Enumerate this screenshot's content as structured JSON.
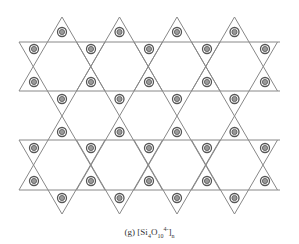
{
  "diagram": {
    "line_color": "#888888",
    "circle_outer_color": "#555555",
    "circle_inner_color": "#999999",
    "layers": [
      {
        "up_apex_y": 17,
        "base_y": 91,
        "down_top_y": 42,
        "down_apex_y": 116
      },
      {
        "up_apex_y": 116,
        "base_y": 190,
        "down_top_y": 140,
        "down_apex_y": 214
      }
    ],
    "star_centers_x": [
      62,
      119.5,
      177,
      234.5
    ],
    "half_width": 43,
    "horizontal_lines": [
      {
        "y": 42,
        "x1": 19,
        "x2": 280
      },
      {
        "y": 91,
        "x1": 19,
        "x2": 280
      },
      {
        "y": 140,
        "x1": 19,
        "x2": 280
      },
      {
        "y": 190,
        "x1": 19,
        "x2": 280
      }
    ],
    "circles": [
      {
        "x": 62,
        "y": 32
      },
      {
        "x": 119.5,
        "y": 32
      },
      {
        "x": 177,
        "y": 32
      },
      {
        "x": 234.5,
        "y": 32
      },
      {
        "x": 34,
        "y": 49
      },
      {
        "x": 91,
        "y": 49
      },
      {
        "x": 149,
        "y": 49
      },
      {
        "x": 207,
        "y": 49
      },
      {
        "x": 265,
        "y": 49
      },
      {
        "x": 34,
        "y": 82
      },
      {
        "x": 91,
        "y": 82
      },
      {
        "x": 149,
        "y": 82
      },
      {
        "x": 207,
        "y": 82
      },
      {
        "x": 265,
        "y": 82
      },
      {
        "x": 62,
        "y": 99
      },
      {
        "x": 119.5,
        "y": 99
      },
      {
        "x": 177,
        "y": 99
      },
      {
        "x": 234.5,
        "y": 99
      },
      {
        "x": 62,
        "y": 132
      },
      {
        "x": 119.5,
        "y": 132
      },
      {
        "x": 177,
        "y": 132
      },
      {
        "x": 234.5,
        "y": 132
      },
      {
        "x": 34,
        "y": 148
      },
      {
        "x": 91,
        "y": 148
      },
      {
        "x": 149,
        "y": 148
      },
      {
        "x": 207,
        "y": 148
      },
      {
        "x": 265,
        "y": 148
      },
      {
        "x": 34,
        "y": 181
      },
      {
        "x": 91,
        "y": 181
      },
      {
        "x": 149,
        "y": 181
      },
      {
        "x": 207,
        "y": 181
      },
      {
        "x": 265,
        "y": 181
      },
      {
        "x": 62,
        "y": 198
      },
      {
        "x": 119.5,
        "y": 198
      },
      {
        "x": 177,
        "y": 198
      },
      {
        "x": 234.5,
        "y": 198
      }
    ]
  },
  "caption": {
    "label": "(g)",
    "open": "[Si",
    "si_sub": "4",
    "o": "O",
    "o_sub": "10",
    "o_sup": "4-",
    "close": "]",
    "n_sub": "n"
  }
}
